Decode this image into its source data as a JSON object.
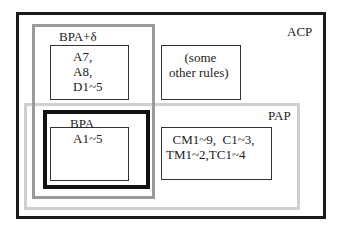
{
  "diagram": {
    "type": "nested-set-diagram",
    "containers": {
      "acp": {
        "label": "ACP",
        "border_color": "#1a1a1a"
      },
      "bpa_delta": {
        "label": "BPA+δ",
        "border_color": "#9a9a9a"
      },
      "pap": {
        "label": "PAP",
        "border_color": "#d0d0d0"
      },
      "bpa": {
        "label": "BPA",
        "border_color": "#111111"
      }
    },
    "rule_boxes": {
      "a7_a8_d": {
        "text": "A7,\nA8,\nD1~5"
      },
      "other_rules": {
        "text": " (some\nother rules)"
      },
      "a1": {
        "text": "A1~5"
      },
      "cm_c_tm_tc": {
        "text": "  CM1~9,  C1~3,\nTM1~2,TC1~4"
      }
    }
  }
}
